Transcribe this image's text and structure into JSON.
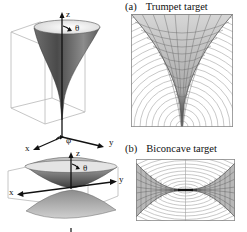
{
  "figure": {
    "panels": [
      {
        "id": "a",
        "tag": "(a)",
        "title": "Trumpet target",
        "shape": "trumpet",
        "axes3d": {
          "z": "z",
          "theta": "θ",
          "phi": "φ",
          "x": "x",
          "y": "y"
        }
      },
      {
        "id": "b",
        "tag": "(b)",
        "title": "Biconcave target",
        "shape": "biconcave",
        "axes3d": {
          "z": "z",
          "theta": "θ",
          "x": "x",
          "y": "y"
        }
      }
    ],
    "colors": {
      "line": "#222222",
      "box": "#b5b5b5",
      "arc": "#a8a8a8",
      "mesh_fill": "#cfcfcf",
      "mesh_line": "#555555",
      "surface_dark": "#3a3a3a",
      "surface_mid": "#8a8a8a",
      "surface_light": "#e8e8e8"
    }
  }
}
